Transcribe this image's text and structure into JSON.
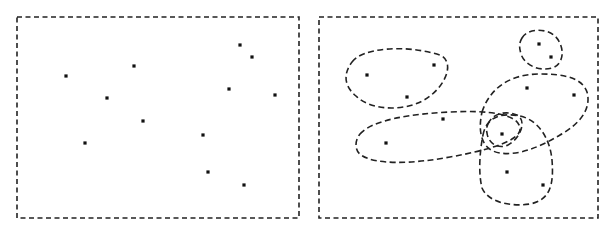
{
  "diagram": {
    "type": "hypergraph-illustration",
    "panels": [
      {
        "id": "vertices-only",
        "description": "Set of vertices without hyperedges",
        "vertices": [
          "v1",
          "v2",
          "v3",
          "v4",
          "v5",
          "v6",
          "v7",
          "v8",
          "v9",
          "v10",
          "v11",
          "v12"
        ]
      },
      {
        "id": "with-hyperedges",
        "description": "Same vertices grouped by dashed hyperedges",
        "vertices": [
          "v1",
          "v2",
          "v3",
          "v4",
          "v5",
          "v6",
          "v7",
          "v8",
          "v9",
          "v10",
          "v11",
          "v12"
        ],
        "hyperedges": [
          {
            "id": "e1",
            "members": [
              "v1",
              "v2",
              "v3"
            ]
          },
          {
            "id": "e2",
            "members": [
              "v4",
              "v5",
              "v10"
            ]
          },
          {
            "id": "e3",
            "members": [
              "v6",
              "v7"
            ]
          },
          {
            "id": "e4",
            "members": [
              "v8",
              "v9",
              "v10"
            ]
          },
          {
            "id": "e5",
            "members": [
              "v10"
            ]
          },
          {
            "id": "e6",
            "members": [
              "v10",
              "v11",
              "v12"
            ]
          }
        ]
      }
    ],
    "colors": {
      "stroke": "#222222",
      "vertex": "#111111",
      "background": "#ffffff"
    }
  }
}
